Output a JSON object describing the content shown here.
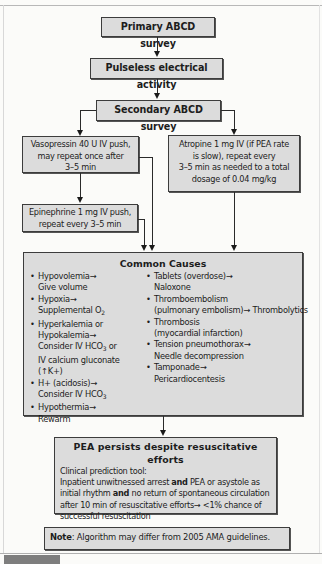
{
  "flowchart": {
    "primary": "Primary ABCD survey",
    "pulseless": "Pulseless electrical activity",
    "secondary": "Secondary ABCD survey",
    "vasopressin": [
      "Vasopressin 40 U IV push,",
      "may repeat once after",
      "3–5 min"
    ],
    "atropine": [
      "Atropine 1 mg IV (if PEA rate",
      "is slow), repeat every",
      "3–5 min as needed to a total",
      "dosage of 0.04 mg/kg"
    ],
    "epinephrine": [
      "Epinephrine 1 mg IV push,",
      "repeat every 3–5 min"
    ],
    "common_causes": {
      "title": "Common Causes",
      "bullet": "•",
      "left": [
        {
          "line1": "Hypovolemia→",
          "line2": "Give volume"
        },
        {
          "line1": "Hypoxia→",
          "line2": "Supplemental O",
          "line2_sub": "2"
        },
        {
          "line1": "Hyperkalemia or",
          "line2": "Hypokalemia→",
          "line3": "Consider IV HCO",
          "line3_sub": "3",
          "line3_tail": " or",
          "line4": "IV calcium gluconate (↑K+)"
        },
        {
          "line1": "H+ (acidosis)→",
          "line2": "Consider IV HCO",
          "line2_sub": "3"
        },
        {
          "line1": "Hypothermia→",
          "line2": "Rewarm"
        }
      ],
      "right": [
        {
          "line1": "Tablets (overdose)→",
          "line2": "Naloxone"
        },
        {
          "line1": "Thromboembolism",
          "line2": "(pulmonary embolism)→ Thrombolytics"
        },
        {
          "line1": "Thrombosis",
          "line2": "(myocardial infarction)"
        },
        {
          "line1": "Tension pneumothorax→",
          "line2": "Needle decompression"
        },
        {
          "line1": "Tamponade→",
          "line2": "Pericardiocentesis"
        }
      ]
    },
    "pea_persists": {
      "title": "PEA persists despite resuscitative efforts",
      "subtitle": "Clinical prediction tool:",
      "text_1": "Inpatient unwitnessed arrest ",
      "and_1": "and",
      "text_2": " PEA or asystole as initial rhythm ",
      "and_2": "and",
      "text_3": " no return of spontaneous circulation after 10 min of resuscitative efforts→ <1% chance of successful resuscitation"
    },
    "note": {
      "label": "Note",
      "text": ": Algorithm may differ from 2005 AMA guidelines."
    }
  }
}
